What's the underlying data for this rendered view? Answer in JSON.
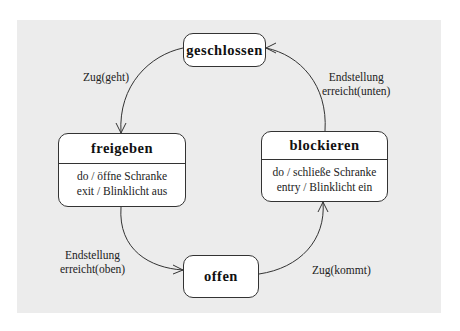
{
  "diagram": {
    "type": "state-machine",
    "states": {
      "geschlossen": {
        "name": "geschlossen"
      },
      "freigeben": {
        "name": "freigeben",
        "actions": [
          "do / öffne Schranke",
          "exit / Blinklicht aus"
        ]
      },
      "blockieren": {
        "name": "blockieren",
        "actions": [
          "do / schließe Schranke",
          "entry / Blinklicht ein"
        ]
      },
      "offen": {
        "name": "offen"
      }
    },
    "transitions": [
      {
        "from": "geschlossen",
        "to": "freigeben",
        "label": [
          "Zug(geht)"
        ]
      },
      {
        "from": "freigeben",
        "to": "offen",
        "label": [
          "Endstellung",
          "erreicht(oben)"
        ]
      },
      {
        "from": "offen",
        "to": "blockieren",
        "label": [
          "Zug(kommt)"
        ]
      },
      {
        "from": "blockieren",
        "to": "geschlossen",
        "label": [
          "Endstellung",
          "erreicht(unten)"
        ]
      }
    ]
  },
  "colors": {
    "background": "#ffffff",
    "panel": "#ececec",
    "state_fill": "#ffffff",
    "stroke": "#333333"
  }
}
